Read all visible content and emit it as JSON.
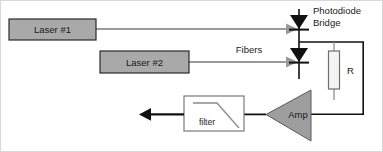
{
  "figure": {
    "background": "#ffffff",
    "border_color": "#d8d8d8"
  },
  "colors": {
    "block_fill": "#a9a9a9",
    "block_stroke": "#2b2b2b",
    "wire_black": "#111111",
    "fiber_gray": "#9a9a9a",
    "amp_fill": "#9e9e9e",
    "filter_fill": "#ffffff",
    "resistor_fill": "#f4f4f4",
    "text": "#1a1a1a"
  },
  "blocks": {
    "laser1": {
      "label": "Laser #1"
    },
    "laser2": {
      "label": "Laser #2"
    },
    "amp": {
      "label": "Amp"
    },
    "filter": {
      "label": "filter"
    },
    "resistor": {
      "label": "R"
    }
  },
  "annotations": {
    "photodiode_bridge_line1": "Photodiode",
    "photodiode_bridge_line2": "Bridge",
    "fibers": "Fibers"
  },
  "icons": {
    "diode_top": "photodiode-symbol",
    "diode_bottom": "photodiode-symbol",
    "fiber_arrow_1": "arrow-right",
    "fiber_arrow_2": "arrow-right",
    "output_arrow": "arrow-left",
    "filter_response": "lowpass-curve"
  }
}
